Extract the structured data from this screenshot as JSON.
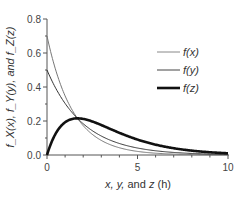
{
  "chart_data": {
    "type": "line",
    "title": "",
    "xlabel": "x, y, and z (h)",
    "ylabel": "f_X(x), f_Y(y), and f_Z(z)",
    "xlim": [
      0,
      10
    ],
    "ylim": [
      0,
      0.8
    ],
    "x_ticks": [
      "0",
      "5",
      "10"
    ],
    "y_ticks": [
      "0.0",
      "0.2",
      "0.4",
      "0.6",
      "0.8"
    ],
    "grid": false,
    "legend_position": "upper right",
    "series": [
      {
        "name": "f(x)",
        "style": "thin gray",
        "rate": 0.7,
        "x": [
          0,
          0.5,
          1,
          1.5,
          2,
          2.5,
          3,
          4,
          5,
          6,
          7,
          8,
          9,
          10
        ],
        "values": [
          0.7,
          0.49,
          0.35,
          0.24,
          0.17,
          0.12,
          0.09,
          0.04,
          0.02,
          0.01,
          0.01,
          0.0,
          0.0,
          0.0
        ]
      },
      {
        "name": "f(y)",
        "style": "thin dark",
        "rate": 0.5,
        "x": [
          0,
          0.5,
          1,
          1.5,
          2,
          2.5,
          3,
          4,
          5,
          6,
          7,
          8,
          9,
          10
        ],
        "values": [
          0.5,
          0.39,
          0.3,
          0.24,
          0.18,
          0.14,
          0.11,
          0.07,
          0.04,
          0.02,
          0.02,
          0.01,
          0.01,
          0.0
        ]
      },
      {
        "name": "f(z)",
        "style": "thick black",
        "x": [
          0,
          0.5,
          1,
          1.5,
          2,
          2.5,
          3,
          4,
          5,
          6,
          7,
          8,
          9,
          10
        ],
        "values": [
          0.0,
          0.12,
          0.18,
          0.21,
          0.21,
          0.2,
          0.19,
          0.15,
          0.11,
          0.08,
          0.05,
          0.04,
          0.03,
          0.02
        ]
      }
    ]
  },
  "axes": {
    "xlabel_parts": {
      "pre": "x, y, ",
      "and": "and ",
      "z": "z",
      "unit": " (h)"
    },
    "ylabel": "f_X(x), f_Y(y), and f_Z(z)"
  },
  "legend": [
    {
      "label": "f(x)"
    },
    {
      "label": "f(y)"
    },
    {
      "label": "f(z)"
    }
  ]
}
